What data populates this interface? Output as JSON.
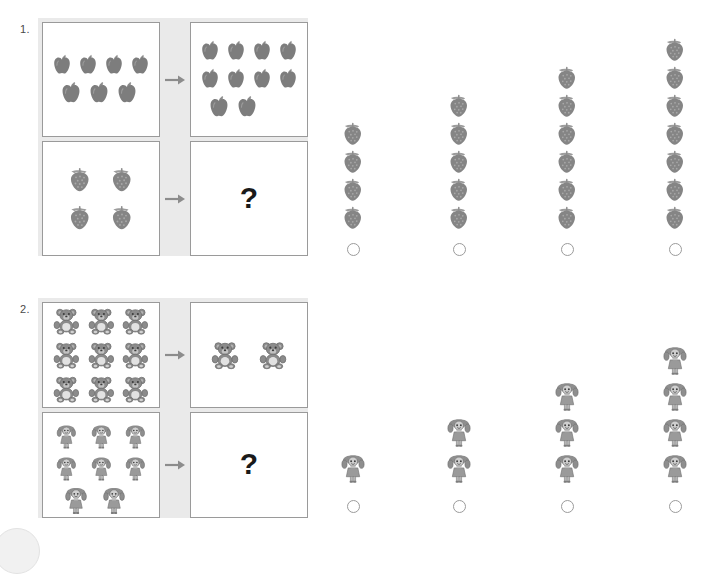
{
  "worksheet": {
    "questions": [
      {
        "number": "1.",
        "matrix": {
          "rows": [
            {
              "left": {
                "icon": "apple-icon",
                "count": 7,
                "per_row": 4
              },
              "arrow": "arrow-right-icon",
              "right": {
                "icon": "apple-icon",
                "count": 10,
                "per_row": 4
              }
            },
            {
              "left": {
                "icon": "strawberry-icon",
                "count": 4,
                "per_row": 2
              },
              "arrow": "arrow-right-icon",
              "right": {
                "icon": "question-mark",
                "label": "?"
              }
            }
          ]
        },
        "options": [
          {
            "icon": "strawberry-icon",
            "count": 4,
            "radio": "radio-unselected"
          },
          {
            "icon": "strawberry-icon",
            "count": 5,
            "radio": "radio-unselected"
          },
          {
            "icon": "strawberry-icon",
            "count": 6,
            "radio": "radio-unselected"
          },
          {
            "icon": "strawberry-icon",
            "count": 7,
            "radio": "radio-unselected"
          }
        ]
      },
      {
        "number": "2.",
        "matrix": {
          "rows": [
            {
              "left": {
                "icon": "teddy-bear-icon",
                "count": 9,
                "per_row": 3
              },
              "arrow": "arrow-right-icon",
              "right": {
                "icon": "teddy-bear-icon",
                "count": 2,
                "per_row": 2
              }
            },
            {
              "left": {
                "icon": "doll-icon",
                "count": 8,
                "per_row": 3
              },
              "arrow": "arrow-right-icon",
              "right": {
                "icon": "question-mark",
                "label": "?"
              }
            }
          ]
        },
        "options": [
          {
            "icon": "doll-icon",
            "count": 1,
            "radio": "radio-unselected"
          },
          {
            "icon": "doll-icon",
            "count": 2,
            "radio": "radio-unselected"
          },
          {
            "icon": "doll-icon",
            "count": 3,
            "radio": "radio-unselected"
          },
          {
            "icon": "doll-icon",
            "count": 4,
            "radio": "radio-unselected"
          }
        ]
      }
    ],
    "question_mark_label": "?",
    "colors": {
      "matrix_background": "#eaeaea",
      "cell_background": "#ffffff",
      "cell_border": "#9a9a9a",
      "icon_gray": "#808080",
      "arrow_gray": "#8c8c8c",
      "radio_border": "#9b9b9b",
      "page_background": "#ffffff"
    },
    "corner_decoration": "partial-circle"
  }
}
